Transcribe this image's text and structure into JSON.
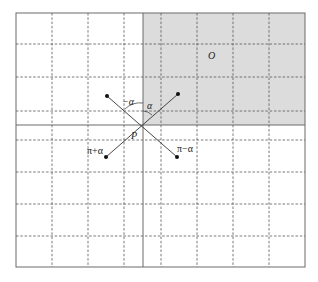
{
  "diagram": {
    "type": "geometric-grid-diagram",
    "width": 318,
    "height": 282,
    "colors": {
      "background": "#ffffff",
      "shaded_region": "#dcdcdc",
      "border": "#6b6b6b",
      "dashed_grid": "#555555",
      "solid_axes": "#6b6b6b",
      "rays": "#333333",
      "points": "#111111"
    },
    "frame": {
      "x1": 16,
      "y1": 13,
      "x2": 305,
      "y2": 267
    },
    "grid": {
      "vertical_dashed_x": [
        52,
        88,
        124,
        161,
        197,
        233,
        269
      ],
      "horizontal_dashed_y": [
        44,
        77,
        111,
        140,
        172,
        204,
        236
      ],
      "vertical_solid_x": 143,
      "horizontal_solid_y": 125
    },
    "shaded_region": {
      "description": "upper-right quadrant relative to the solid axes",
      "x1": 143,
      "y1": 13,
      "x2": 305,
      "y2": 125
    },
    "center_point": {
      "x": 142,
      "y": 124
    },
    "endpoints": [
      {
        "name": "upper-left",
        "x": 107,
        "y": 96
      },
      {
        "name": "upper-right",
        "x": 178,
        "y": 94
      },
      {
        "name": "lower-left",
        "x": 106,
        "y": 157
      },
      {
        "name": "lower-right",
        "x": 177,
        "y": 157
      }
    ],
    "labels": {
      "region": {
        "text": "O",
        "x": 208,
        "y": 59
      },
      "point": {
        "text": "P",
        "x": 131,
        "y": 139
      },
      "neg_alpha": {
        "text": "−α",
        "x": 122,
        "y": 105
      },
      "alpha": {
        "text": "α",
        "x": 147,
        "y": 109
      },
      "pi_plus_alpha": {
        "text": "π+α",
        "x": 87,
        "y": 154
      },
      "pi_minus_alpha": {
        "text": "π−α",
        "x": 177,
        "y": 152
      }
    }
  }
}
